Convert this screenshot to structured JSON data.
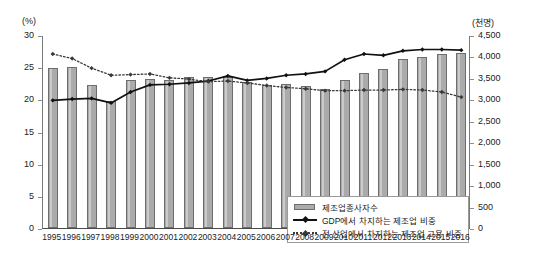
{
  "chart_data": {
    "type": "bar",
    "title": "",
    "subtitle": "",
    "xlabel": "",
    "ylabel": "(%)",
    "y2label": "(천명)",
    "grid": false,
    "legend_position": "inside-bottom-right",
    "categories": [
      "1995",
      "1996",
      "1997",
      "1998",
      "1999",
      "2000",
      "2001",
      "2002",
      "2003",
      "2004",
      "2005",
      "2006",
      "2007",
      "2008",
      "2009",
      "2010",
      "2011",
      "2012",
      "2013",
      "2014",
      "2015",
      "2016"
    ],
    "ylim": [
      0,
      30
    ],
    "yticks": [
      "0",
      "5",
      "10",
      "15",
      "20",
      "25",
      "30"
    ],
    "y2lim": [
      0,
      4500
    ],
    "y2ticks": [
      "0",
      "500",
      "1,000",
      "1,500",
      "2,000",
      "2,500",
      "3,000",
      "3,500",
      "4,000",
      "4,500"
    ],
    "series": [
      {
        "name": "제조업종사자수",
        "kind": "bar",
        "axis": "right",
        "unit": "천명",
        "values": [
          3720,
          3760,
          3340,
          2970,
          3440,
          3480,
          3450,
          3530,
          3520,
          3530,
          3400,
          3340,
          3360,
          3320,
          3240,
          3450,
          3620,
          3710,
          3930,
          3990,
          4060,
          4080
        ]
      },
      {
        "name": "GDP에서 차지하는 제조업 비중",
        "kind": "line",
        "axis": "left",
        "unit": "%",
        "values": [
          20.0,
          20.2,
          20.3,
          19.6,
          21.3,
          22.4,
          22.5,
          22.7,
          23.0,
          23.8,
          23.1,
          23.4,
          23.9,
          24.1,
          24.5,
          26.3,
          27.2,
          27.0,
          27.7,
          27.9,
          27.9,
          27.8
        ]
      },
      {
        "name": "전 산업에서 차지하는 제조업 고용 비중",
        "kind": "dotted-line",
        "axis": "left",
        "unit": "%",
        "values": [
          27.2,
          26.5,
          25.0,
          23.9,
          24.0,
          24.1,
          23.5,
          23.3,
          22.9,
          23.0,
          22.7,
          22.3,
          22.0,
          21.8,
          21.5,
          21.5,
          21.6,
          21.6,
          21.7,
          21.6,
          21.3,
          20.5
        ]
      }
    ],
    "colors": {
      "bar_fill": "#ababab",
      "bar_stroke": "#6d6d6d",
      "line_solid": "#111111",
      "line_dotted": "#3a3a3a",
      "axis": "#7a7a7a",
      "text": "#1a1a1a"
    }
  }
}
